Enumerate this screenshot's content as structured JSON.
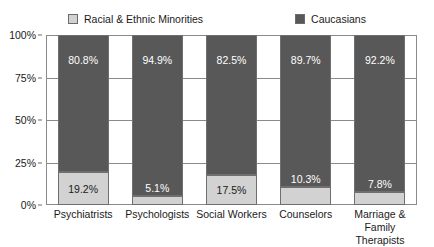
{
  "legend": {
    "position": "top",
    "items": [
      {
        "label": "Racial & Ethnic Minorities",
        "color": "#d2d2d2",
        "icon": "legend-swatch-icon"
      },
      {
        "label": "Caucasians",
        "color": "#585858",
        "icon": "legend-swatch-icon"
      }
    ]
  },
  "axes": {
    "y_ticks": [
      "0%",
      "25%",
      "50%",
      "75%",
      "100%"
    ]
  },
  "chart_data": {
    "type": "bar",
    "title": "",
    "subtitle": "",
    "xlabel": "",
    "ylabel": "",
    "stacked": true,
    "normalized_percent": true,
    "grid": true,
    "legend_position": "top",
    "ylim": [
      0,
      100
    ],
    "ytick_labels": [
      "0%",
      "25%",
      "50%",
      "75%",
      "100%"
    ],
    "ytick_values": [
      0,
      25,
      50,
      75,
      100
    ],
    "categories": [
      "Psychiatrists",
      "Psychologists",
      "Social Workers",
      "Counselors",
      "Marriage & Family Therapists"
    ],
    "category_lines": [
      [
        "Psychiatrists"
      ],
      [
        "Psychologists"
      ],
      [
        "Social Workers"
      ],
      [
        "Counselors"
      ],
      [
        "Marriage &",
        "Family Therapists"
      ]
    ],
    "series": [
      {
        "name": "Racial & Ethnic Minorities",
        "color": "#d2d2d2",
        "values": [
          19.2,
          5.1,
          17.5,
          10.3,
          7.8
        ],
        "data_labels": [
          "19.2%",
          "5.1%",
          "17.5%",
          "10.3%",
          "7.8%"
        ]
      },
      {
        "name": "Caucasians",
        "color": "#585858",
        "values": [
          80.8,
          94.9,
          82.5,
          89.7,
          92.2
        ],
        "data_labels": [
          "80.8%",
          "94.9%",
          "82.5%",
          "89.7%",
          "92.2%"
        ]
      }
    ]
  }
}
